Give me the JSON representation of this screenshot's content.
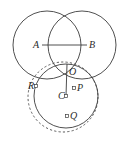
{
  "figure": {
    "canvas": {
      "width": 129,
      "height": 141,
      "background": "#ffffff"
    },
    "stroke_color": "#3c3c3c",
    "dashed_stroke_color": "#4a4a4a",
    "label_color": "#2b2b2b"
  },
  "labels": {
    "A": "A",
    "B": "B",
    "O": "O",
    "P": "P",
    "Q": "Q",
    "R": "R",
    "C": "C"
  },
  "shapes": {
    "circle_left": {
      "name": "circle-A",
      "cx": 47,
      "cy": 45,
      "r": 34,
      "style": "solid"
    },
    "circle_right": {
      "name": "circle-B",
      "cx": 82,
      "cy": 45,
      "r": 34,
      "style": "solid"
    },
    "circle_bottom_solid": {
      "name": "circle-C",
      "cx": 66,
      "cy": 96,
      "r": 32,
      "style": "solid"
    },
    "circle_bottom_dashed": {
      "name": "circle-dashed",
      "cx": 63,
      "cy": 97,
      "r": 35,
      "style": "dashed"
    },
    "segment_AB": {
      "name": "segment-AB",
      "x1": 42,
      "y1": 45,
      "x2": 87,
      "y2": 45
    },
    "segment_OC": {
      "name": "segment-OC",
      "x1": 67,
      "y1": 64,
      "x2": 66,
      "y2": 96
    }
  },
  "points": {
    "O": {
      "x": 67,
      "y": 64
    },
    "C": {
      "x": 66,
      "y": 96
    },
    "P": {
      "x": 74,
      "y": 88
    },
    "Q": {
      "x": 67,
      "y": 116
    },
    "R": {
      "x": 36,
      "y": 86
    }
  }
}
